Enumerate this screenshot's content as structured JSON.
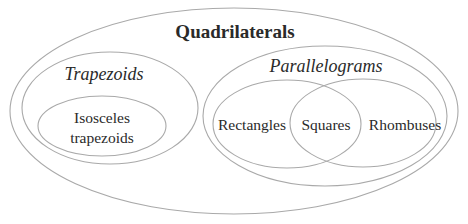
{
  "diagram": {
    "type": "euler-diagram",
    "title": "Quadrilaterals",
    "stroke_color": "#a9a9a9",
    "text_color": "#2a2a2a",
    "background": "#ffffff",
    "sets": [
      {
        "id": "quadrilaterals",
        "label": "Quadrilaterals",
        "style": "bold",
        "ellipse": {
          "cx": 234,
          "cy": 111,
          "rx": 224,
          "ry": 103
        },
        "label_pos": {
          "x": 235,
          "y": 38
        }
      },
      {
        "id": "trapezoids",
        "label": "Trapezoids",
        "style": "italic",
        "parent": "quadrilaterals",
        "ellipse": {
          "cx": 110,
          "cy": 108,
          "rx": 88,
          "ry": 56
        },
        "label_pos": {
          "x": 104,
          "y": 80
        }
      },
      {
        "id": "isosceles-trapezoids",
        "label_lines": [
          "Isosceles",
          "trapezoids"
        ],
        "style": "plain",
        "parent": "trapezoids",
        "ellipse": {
          "cx": 102,
          "cy": 126,
          "rx": 64,
          "ry": 30
        },
        "label_pos": [
          {
            "x": 102,
            "y": 123
          },
          {
            "x": 102,
            "y": 143
          }
        ]
      },
      {
        "id": "parallelograms",
        "label": "Parallelograms",
        "style": "italic",
        "parent": "quadrilaterals",
        "ellipse": {
          "cx": 325,
          "cy": 116,
          "rx": 122,
          "ry": 70
        },
        "label_pos": {
          "x": 326,
          "y": 72
        }
      },
      {
        "id": "rectangles",
        "label": "Rectangles",
        "style": "plain",
        "parent": "parallelograms",
        "ellipse": {
          "cx": 287,
          "cy": 124,
          "rx": 74,
          "ry": 44
        },
        "label_pos": {
          "x": 252,
          "y": 130
        }
      },
      {
        "id": "rhombuses",
        "label": "Rhombuses",
        "style": "plain",
        "parent": "parallelograms",
        "ellipse": {
          "cx": 363,
          "cy": 123,
          "rx": 73,
          "ry": 44
        },
        "label_pos": {
          "x": 405,
          "y": 130
        }
      },
      {
        "id": "squares",
        "label": "Squares",
        "style": "plain",
        "intersection_of": [
          "rectangles",
          "rhombuses"
        ],
        "label_pos": {
          "x": 326,
          "y": 130
        }
      }
    ]
  },
  "labels": {
    "title": "Quadrilaterals",
    "trapezoids": "Trapezoids",
    "isosceles_line1": "Isosceles",
    "isosceles_line2": "trapezoids",
    "parallelograms": "Parallelograms",
    "rectangles": "Rectangles",
    "squares": "Squares",
    "rhombuses": "Rhombuses"
  }
}
